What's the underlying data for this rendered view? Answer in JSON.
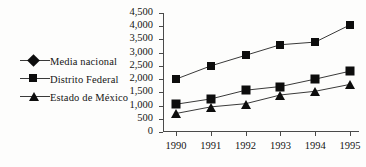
{
  "chart_data": {
    "type": "line",
    "title": "",
    "subtitle": "",
    "xlabel": "",
    "ylabel": "",
    "categories": [
      "1990",
      "1991",
      "1992",
      "1993",
      "1994",
      "1995"
    ],
    "ylim": [
      0,
      4500
    ],
    "ytick_labels": [
      "0",
      "500",
      "1,000",
      "1,500",
      "2,000",
      "2,500",
      "3,000",
      "3,500",
      "4,000",
      "4,500"
    ],
    "ytick_values": [
      0,
      500,
      1000,
      1500,
      2000,
      2500,
      3000,
      3500,
      4000,
      4500
    ],
    "grid": false,
    "legend_position": "left-outside",
    "series": [
      {
        "name": "Media nacional",
        "marker": "diamond",
        "values": [
          1050,
          1250,
          1580,
          1720,
          2000,
          2300
        ]
      },
      {
        "name": "Distrito Federal",
        "marker": "square",
        "values": [
          2000,
          2500,
          2900,
          3300,
          3400,
          4050
        ]
      },
      {
        "name": "Estado de México",
        "marker": "triangle",
        "values": [
          700,
          950,
          1070,
          1400,
          1540,
          1800
        ]
      }
    ]
  },
  "colors": {
    "marker": "#0d0d0d",
    "line": "#3a3a3a",
    "axis": "#4a4a4a",
    "text": "#151515",
    "background": "#fdfdfc"
  }
}
